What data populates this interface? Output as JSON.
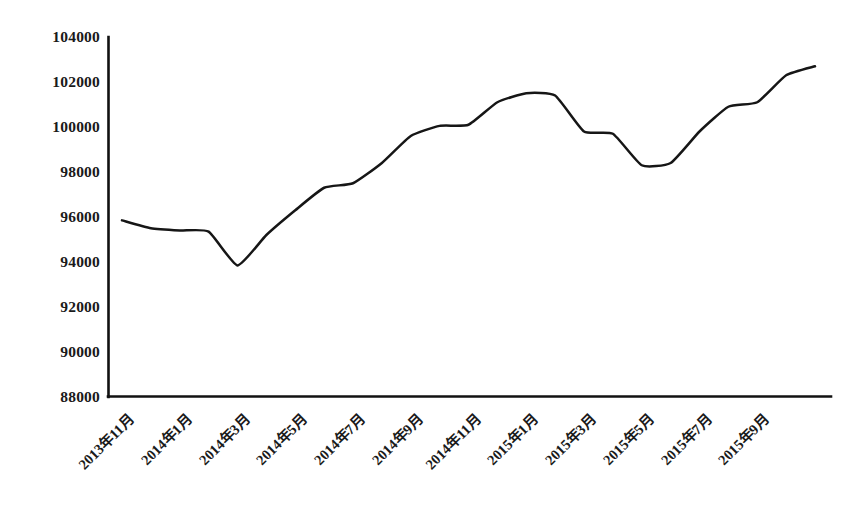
{
  "chart_data": {
    "type": "line",
    "title": "",
    "subtitle": "",
    "xlabel": "",
    "ylabel": "",
    "grid": false,
    "legend": false,
    "legend_position": "none",
    "line_color": "#161616",
    "background_color": "#ffffff",
    "ylim": [
      88000,
      104000
    ],
    "ytick_step": 2000,
    "ytick_labels": [
      "104000",
      "102000",
      "100000",
      "98000",
      "96000",
      "94000",
      "92000",
      "90000",
      "88000"
    ],
    "ytick_values": [
      104000,
      102000,
      100000,
      98000,
      96000,
      94000,
      92000,
      90000,
      88000
    ],
    "xtick_labels": [
      "2013年11月",
      "2014年1月",
      "2014年3月",
      "2014年5月",
      "2014年7月",
      "2014年9月",
      "2014年11月",
      "2015年1月",
      "2015年3月",
      "2015年5月",
      "2015年7月",
      "2015年9月"
    ],
    "x": [
      "2013年11月",
      "2013年12月",
      "2014年1月",
      "2014年2月",
      "2014年3月",
      "2014年4月",
      "2014年5月",
      "2014年6月",
      "2014年7月",
      "2014年8月",
      "2014年9月",
      "2014年10月",
      "2014年11月",
      "2014年12月",
      "2015年1月",
      "2015年2月",
      "2015年3月",
      "2015年4月",
      "2015年5月",
      "2015年6月",
      "2015年7月",
      "2015年8月",
      "2015年9月",
      "2015年10月",
      "2015年11月"
    ],
    "values": [
      95850,
      95500,
      95400,
      95350,
      93850,
      95200,
      96300,
      97300,
      97500,
      98400,
      99600,
      100050,
      100100,
      101100,
      101500,
      101400,
      99800,
      99700,
      98300,
      98400,
      99800,
      100900,
      101100,
      102300,
      102700
    ],
    "series": [
      {
        "name": "指数",
        "values": [
          95850,
          95500,
          95400,
          95350,
          93850,
          95200,
          96300,
          97300,
          97500,
          98400,
          99600,
          100050,
          100100,
          101100,
          101500,
          101400,
          99800,
          99700,
          98300,
          98400,
          99800,
          100900,
          101100,
          102300,
          102700
        ]
      }
    ],
    "annotations": [],
    "notes": {
      "peak_label": "2015年1月",
      "peak_value": 101500,
      "trough_label": "2014年3月",
      "trough_value": 93850,
      "start_value": 95850,
      "end_value": 102700
    }
  }
}
